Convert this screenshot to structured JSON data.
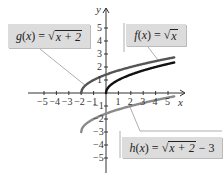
{
  "chart_data": {
    "type": "line",
    "title": "",
    "xlabel": "x",
    "ylabel": "y",
    "xlim": [
      -5,
      5
    ],
    "ylim": [
      -5,
      5
    ],
    "x_ticks": [
      "-5",
      "-4",
      "-3",
      "-2",
      "-1",
      "1",
      "2",
      "3",
      "4",
      "5"
    ],
    "y_ticks": [
      "5",
      "4",
      "3",
      "2",
      "1",
      "-1",
      "-2",
      "-3",
      "-4",
      "-5"
    ],
    "grid": false,
    "series": [
      {
        "name": "f(x) = √x",
        "color": "#111111",
        "domain": [
          0,
          5.5
        ],
        "points": [
          [
            0,
            0
          ],
          [
            1,
            1
          ],
          [
            4,
            2
          ],
          [
            5.5,
            2.35
          ]
        ]
      },
      {
        "name": "g(x) = √(x+2)",
        "color": "#555555",
        "domain": [
          -2,
          5.5
        ],
        "points": [
          [
            -2,
            0
          ],
          [
            -1,
            1
          ],
          [
            2,
            2
          ],
          [
            5.5,
            2.74
          ]
        ]
      },
      {
        "name": "h(x) = √(x+2) − 3",
        "color": "#8a8a8a",
        "domain": [
          -2,
          5.5
        ],
        "points": [
          [
            -2,
            -3
          ],
          [
            -1,
            -2
          ],
          [
            2,
            -1
          ],
          [
            5.5,
            -0.26
          ]
        ]
      }
    ]
  },
  "labels": {
    "g": {
      "name": "g",
      "arg": "x",
      "eq": "=",
      "radicand": "x + 2",
      "tail": ""
    },
    "f": {
      "name": "f",
      "arg": "x",
      "eq": "=",
      "radicand": "x",
      "tail": ""
    },
    "h": {
      "name": "h",
      "arg": "x",
      "eq": "=",
      "radicand": "x + 2",
      "tail": "− 3"
    }
  },
  "axes": {
    "x_label": "x",
    "y_label": "y"
  },
  "colors": {
    "label_bg": "#dcdcdc",
    "f": "#111111",
    "g": "#555555",
    "h": "#8a8a8a"
  }
}
